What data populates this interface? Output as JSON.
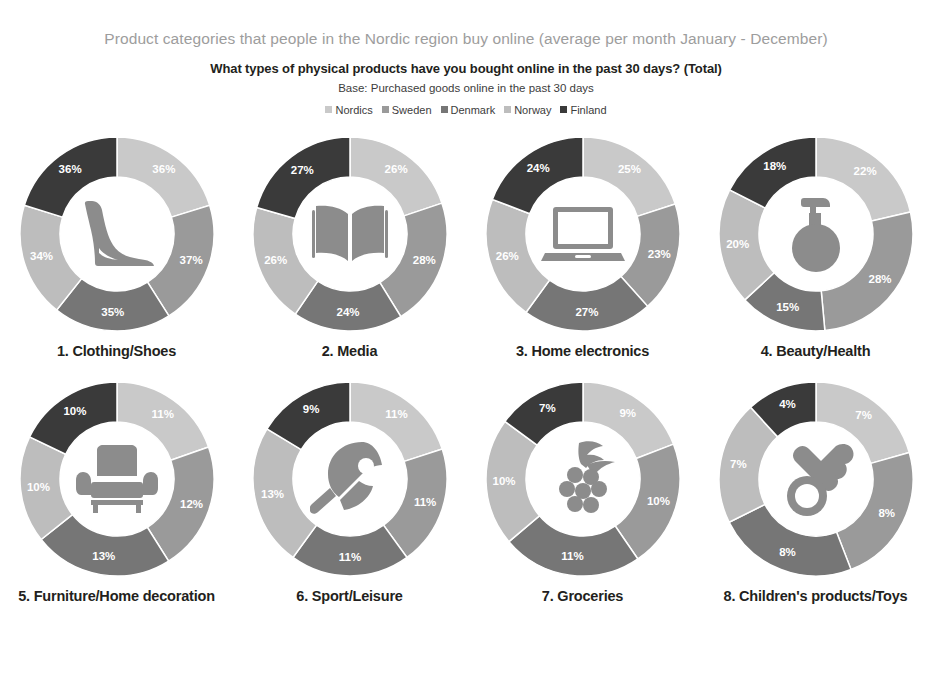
{
  "header": {
    "title": "Product categories that people in the Nordic region buy online (average per month January - December)",
    "question": "What types of physical products have you bought online in the past 30 days? (Total)",
    "base": "Base: Purchased goods online in the past 30 days"
  },
  "legend": {
    "items": [
      {
        "label": "Nordics",
        "color": "#c9c9c9"
      },
      {
        "label": "Sweden",
        "color": "#9a9a9a"
      },
      {
        "label": "Denmark",
        "color": "#767676"
      },
      {
        "label": "Norway",
        "color": "#bdbdbd"
      },
      {
        "label": "Finland",
        "color": "#3a3a3a"
      }
    ]
  },
  "colors": {
    "nordics": "#c9c9c9",
    "sweden": "#9a9a9a",
    "denmark": "#767676",
    "norway": "#bdbdbd",
    "finland": "#3a3a3a",
    "icon": "#8c8c8c",
    "title_gray": "#9d9d9d",
    "text_dark": "#231f20"
  },
  "chart_data": {
    "type": "pie",
    "title": "Product categories that people in the Nordic region buy online (average per month January - December)",
    "subtitle": "What types of physical products have you bought online in the past 30 days? (Total)",
    "note": "Base: Purchased goods online in the past 30 days",
    "legend_position": "top",
    "series_names": [
      "Nordics",
      "Sweden",
      "Denmark",
      "Norway",
      "Finland"
    ],
    "value_suffix": "%",
    "charts": [
      {
        "index": 1,
        "label": "1. Clothing/Shoes",
        "icon": "high-heel-shoe-icon",
        "values": [
          36,
          37,
          35,
          34,
          36
        ],
        "value_labels": [
          "36%",
          "37%",
          "35%",
          "34%",
          "36%"
        ]
      },
      {
        "index": 2,
        "label": "2. Media",
        "icon": "open-book-icon",
        "values": [
          26,
          28,
          24,
          26,
          27
        ],
        "value_labels": [
          "26%",
          "28%",
          "24%",
          "26%",
          "27%"
        ]
      },
      {
        "index": 3,
        "label": "3. Home electronics",
        "icon": "laptop-icon",
        "values": [
          25,
          23,
          27,
          26,
          24
        ],
        "value_labels": [
          "25%",
          "23%",
          "27%",
          "26%",
          "24%"
        ]
      },
      {
        "index": 4,
        "label": "4. Beauty/Health",
        "icon": "perfume-bottle-icon",
        "values": [
          22,
          28,
          15,
          20,
          18
        ],
        "value_labels": [
          "22%",
          "28%",
          "15%",
          "20%",
          "18%"
        ]
      },
      {
        "index": 5,
        "label": "5. Furniture/Home decoration",
        "icon": "armchair-icon",
        "values": [
          11,
          12,
          13,
          10,
          10
        ],
        "value_labels": [
          "11%",
          "12%",
          "13%",
          "10%",
          "10%"
        ]
      },
      {
        "index": 6,
        "label": "6. Sport/Leisure",
        "icon": "table-tennis-paddle-icon",
        "values": [
          11,
          11,
          11,
          13,
          9
        ],
        "value_labels": [
          "11%",
          "11%",
          "11%",
          "13%",
          "9%"
        ]
      },
      {
        "index": 7,
        "label": "7. Groceries",
        "icon": "grapes-icon",
        "values": [
          9,
          10,
          11,
          10,
          7
        ],
        "value_labels": [
          "9%",
          "10%",
          "11%",
          "10%",
          "7%"
        ]
      },
      {
        "index": 8,
        "label": "8. Children's products/Toys",
        "icon": "pacifier-icon",
        "values": [
          7,
          8,
          8,
          7,
          4
        ],
        "value_labels": [
          "7%",
          "8%",
          "8%",
          "7%",
          "4%"
        ]
      }
    ]
  }
}
